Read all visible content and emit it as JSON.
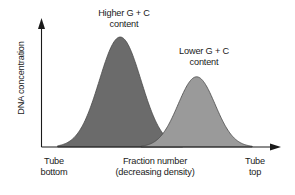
{
  "chart_data": {
    "type": "area",
    "title": "",
    "subtitle": "",
    "xlabel": "Fraction number (decreasing density)",
    "ylabel": "DNA concentration",
    "xlim": [
      0,
      100
    ],
    "ylim": [
      0,
      100
    ],
    "grid": false,
    "legend_position": "none",
    "axis_tick_labels": {
      "x_left": "Tube bottom",
      "x_right": "Tube top"
    },
    "annotations": [
      {
        "name": "higher-gc-peak-label",
        "text": "Higher G + C\ncontent",
        "points_to_series": "Higher G + C content"
      },
      {
        "name": "lower-gc-peak-label",
        "text": "Lower G + C\ncontent",
        "points_to_series": "Lower G + C content"
      }
    ],
    "series": [
      {
        "name": "Higher G + C content",
        "color": "#6b6b6b",
        "peak_center_x": 34,
        "peak_height": 94,
        "peak_half_width": 9,
        "x": [
          18,
          21,
          24,
          26,
          28,
          30,
          32,
          34,
          36,
          38,
          40,
          42,
          44,
          47,
          50
        ],
        "values": [
          0,
          1,
          3,
          8,
          22,
          52,
          82,
          94,
          90,
          72,
          42,
          18,
          6,
          1,
          0
        ]
      },
      {
        "name": "Lower G + C content",
        "color": "#9a9a9a",
        "peak_center_x": 67,
        "peak_height": 60,
        "peak_half_width": 8,
        "x": [
          53,
          56,
          58,
          60,
          62,
          64,
          66,
          67,
          69,
          71,
          73,
          75,
          77,
          79,
          82
        ],
        "values": [
          0,
          1,
          3,
          8,
          20,
          40,
          56,
          60,
          57,
          45,
          27,
          12,
          4,
          1,
          0
        ]
      }
    ]
  },
  "axes": {
    "y_axis_label": "DNA concentration",
    "x_axis_label_center": "Fraction number\n(decreasing density)",
    "x_axis_label_left": "Tube\nbottom",
    "x_axis_label_right": "Tube\ntop"
  },
  "labels": {
    "higher_gc": "Higher G + C\ncontent",
    "lower_gc": "Lower G + C\ncontent"
  },
  "colors": {
    "peak_high_gc": "#6b6b6b",
    "peak_low_gc": "#9a9a9a",
    "axis": "#1a1a1a",
    "background": "#ffffff"
  }
}
